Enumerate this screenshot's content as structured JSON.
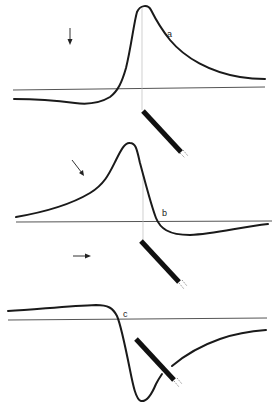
{
  "figure": {
    "colors": {
      "trace": "#1a1a1a",
      "baseline": "#555555",
      "guide": "#bbbbbb",
      "electrode": "#111111",
      "background": "#ffffff"
    },
    "panels": [
      {
        "id": "a",
        "label": "a",
        "arrow_direction": "down",
        "waveform": "positive peak (monophasic-positive with small negative pre-dip)"
      },
      {
        "id": "b",
        "label": "b",
        "arrow_direction": "down-right",
        "waveform": "positive peak followed by small negative trough (biphasic)"
      },
      {
        "id": "c",
        "label": "c",
        "arrow_direction": "right",
        "waveform": "small positive plateau followed by large negative trough"
      }
    ]
  }
}
